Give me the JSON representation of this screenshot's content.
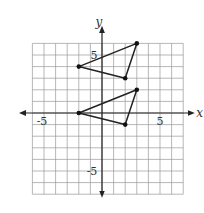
{
  "chart_data": {
    "type": "scatter",
    "title": "",
    "xlabel": "x",
    "ylabel": "y",
    "xlim": [
      -6,
      7
    ],
    "ylim": [
      -7,
      6
    ],
    "grid": true,
    "tick_labels": {
      "x": [
        {
          "value": -5,
          "label": "-5"
        },
        {
          "value": 5,
          "label": "5"
        }
      ],
      "y": [
        {
          "value": 5,
          "label": "5"
        },
        {
          "value": -5,
          "label": "-5"
        }
      ]
    },
    "series": [
      {
        "name": "upper-triangle",
        "closed": true,
        "points": [
          [
            -2,
            4
          ],
          [
            3,
            6
          ],
          [
            2,
            3
          ]
        ]
      },
      {
        "name": "lower-triangle",
        "closed": true,
        "points": [
          [
            -2,
            0
          ],
          [
            3,
            2
          ],
          [
            2,
            -1
          ]
        ]
      }
    ]
  },
  "labels": {
    "x_axis": "x",
    "y_axis": "y",
    "x_neg5": "-5",
    "x_pos5": "5",
    "y_pos5": "5",
    "y_neg5": "-5"
  }
}
